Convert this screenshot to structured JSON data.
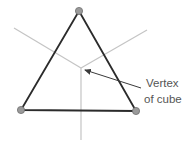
{
  "diagram": {
    "label_line1": "Vertex",
    "label_line2": "of cube",
    "colors": {
      "triangle_stroke": "#2b2b2b",
      "cube_edge": "#c4c4c4",
      "vertex_dot_fill": "#9a9a9a",
      "vertex_dot_stroke": "#6e6e6e",
      "arrow": "#3a3a3a",
      "label_text": "#555555"
    },
    "triangle_vertices": [
      [
        79,
        11
      ],
      [
        21,
        110
      ],
      [
        136,
        111
      ]
    ],
    "cube_vertex": [
      81,
      68
    ],
    "cube_edges_ends": [
      [
        14,
        28
      ],
      [
        147,
        30
      ],
      [
        81,
        140
      ]
    ]
  }
}
